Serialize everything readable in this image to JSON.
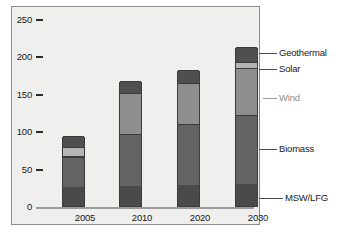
{
  "chart_data": {
    "type": "bar",
    "stacked": true,
    "title": "",
    "xlabel": "",
    "ylabel": "",
    "categories": [
      "2005",
      "2010",
      "2020",
      "2030"
    ],
    "ylim": [
      0,
      250
    ],
    "yticks": [
      0,
      50,
      100,
      150,
      200,
      250
    ],
    "ytick_labels": [
      "0",
      "50",
      "100",
      "150",
      "200",
      "250"
    ],
    "grid": false,
    "legend_position": "right-callouts",
    "series": [
      {
        "name": "MSW/LFG",
        "color": "#4a4a4a",
        "values": [
          25,
          27,
          28,
          30
        ]
      },
      {
        "name": "Biomass",
        "color": "#636363",
        "values": [
          40,
          69,
          82,
          92
        ]
      },
      {
        "name": "Wind",
        "color": "#8e8e8e",
        "values": [
          2,
          55,
          55,
          62
        ]
      },
      {
        "name": "Solar",
        "color": "#b4b4b4",
        "values": [
          12,
          0,
          0,
          8
        ]
      },
      {
        "name": "Geothermal",
        "color": "#4f4f4f",
        "values": [
          14,
          16,
          17,
          20
        ]
      }
    ],
    "totals": [
      93,
      167,
      182,
      212
    ]
  },
  "axis": {
    "y_ticks": [
      {
        "label": "250",
        "value": 250
      },
      {
        "label": "200",
        "value": 200
      },
      {
        "label": "150",
        "value": 150
      },
      {
        "label": "100",
        "value": 100
      },
      {
        "label": "50",
        "value": 50
      },
      {
        "label": "0",
        "value": 0
      }
    ],
    "x_labels": [
      "2005",
      "2010",
      "2020",
      "2030"
    ]
  },
  "legend": {
    "items": [
      {
        "label": "Geothermal",
        "color": "#4f4f4f",
        "muted": false
      },
      {
        "label": "Solar",
        "color": "#b4b4b4",
        "muted": false
      },
      {
        "label": "Wind",
        "color": "#8e8e8e",
        "muted": true
      },
      {
        "label": "Biomass",
        "color": "#636363",
        "muted": false
      },
      {
        "label": "MSW/LFG",
        "color": "#4a4a4a",
        "muted": false
      }
    ]
  },
  "colors": {
    "panel_background": "#efefed",
    "panel_border": "#8d8d8d",
    "axis": "#9a9a9a",
    "bar_outline": "#3b3b3b",
    "text": "#1a1a1a",
    "muted_text": "#8f8f8f"
  }
}
